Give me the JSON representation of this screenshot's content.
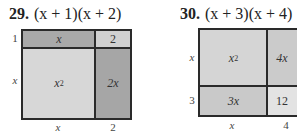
{
  "problems": [
    {
      "number": "29.",
      "expression": "(x + 1)(x + 2)",
      "row_labels": [
        "1",
        "x"
      ],
      "col_labels": [
        "x",
        "2"
      ],
      "cells": [
        {
          "text": "x",
          "color": "#a9a9a9"
        },
        {
          "text": "2",
          "color": "#d0d0d0"
        },
        {
          "text": "x",
          "sup": "2",
          "color": "#d7d7d7"
        },
        {
          "text": "2x",
          "color": "#a6a6a6"
        }
      ]
    },
    {
      "number": "30.",
      "expression": "(x + 3)(x + 4)",
      "row_labels": [
        "x",
        "3"
      ],
      "col_labels": [
        "x",
        "4"
      ],
      "cells": [
        {
          "text": "x",
          "sup": "2",
          "color": "#d5d5d5"
        },
        {
          "text": "4x",
          "color": "#cbcbcb"
        },
        {
          "text": "3x",
          "color": "#c9c9c9"
        },
        {
          "text": "12",
          "color": "#e3e3e3"
        }
      ]
    }
  ]
}
